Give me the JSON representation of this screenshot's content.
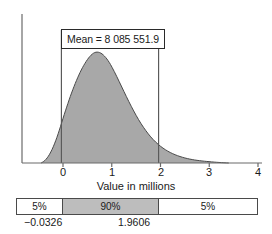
{
  "chart_data": {
    "type": "area",
    "title": "",
    "xlabel": "Value in millions",
    "ylabel": "",
    "xlim": [
      -0.95,
      4.2
    ],
    "ylim": [
      0,
      1.12
    ],
    "grid": false,
    "legend": null,
    "xticks": [
      0,
      1,
      2,
      3,
      4
    ],
    "xtick_labels": [
      "0",
      "1",
      "2",
      "3",
      "4"
    ],
    "distribution": "right-skewed density of sampling distribution of the mean",
    "annotations": [
      {
        "name": "mean-callout",
        "text": "Mean = 8 085 551.9",
        "value": 8085551.9
      }
    ],
    "markers": [
      {
        "name": "lower-bound-line",
        "x": -0.0326,
        "label": "-0.0326"
      },
      {
        "name": "upper-bound-line",
        "x": 1.9606,
        "label": "1.9606"
      }
    ],
    "interval_bar": {
      "segments": [
        {
          "label": "5%",
          "percent": 5,
          "shaded": false
        },
        {
          "label": "90%",
          "percent": 90,
          "shaded": true
        },
        {
          "label": "5%",
          "percent": 5,
          "shaded": false
        }
      ],
      "boundaries": [
        "−0.0326",
        "1.9606"
      ]
    },
    "curve_points": [
      [
        -0.45,
        0.0
      ],
      [
        -0.4,
        0.012
      ],
      [
        -0.35,
        0.032
      ],
      [
        -0.3,
        0.06
      ],
      [
        -0.25,
        0.098
      ],
      [
        -0.2,
        0.145
      ],
      [
        -0.15,
        0.2
      ],
      [
        -0.1,
        0.262
      ],
      [
        -0.05,
        0.33
      ],
      [
        0.0,
        0.402
      ],
      [
        0.05,
        0.47
      ],
      [
        0.1,
        0.536
      ],
      [
        0.15,
        0.6
      ],
      [
        0.2,
        0.66
      ],
      [
        0.25,
        0.716
      ],
      [
        0.3,
        0.768
      ],
      [
        0.35,
        0.816
      ],
      [
        0.4,
        0.86
      ],
      [
        0.45,
        0.898
      ],
      [
        0.5,
        0.932
      ],
      [
        0.55,
        0.96
      ],
      [
        0.6,
        0.982
      ],
      [
        0.65,
        0.996
      ],
      [
        0.7,
        1.0
      ],
      [
        0.75,
        0.996
      ],
      [
        0.8,
        0.984
      ],
      [
        0.85,
        0.964
      ],
      [
        0.9,
        0.938
      ],
      [
        0.95,
        0.906
      ],
      [
        1.0,
        0.868
      ],
      [
        1.1,
        0.782
      ],
      [
        1.2,
        0.69
      ],
      [
        1.3,
        0.598
      ],
      [
        1.4,
        0.51
      ],
      [
        1.5,
        0.428
      ],
      [
        1.6,
        0.354
      ],
      [
        1.7,
        0.29
      ],
      [
        1.8,
        0.234
      ],
      [
        1.9,
        0.188
      ],
      [
        2.0,
        0.15
      ],
      [
        2.1,
        0.119
      ],
      [
        2.2,
        0.094
      ],
      [
        2.3,
        0.074
      ],
      [
        2.4,
        0.058
      ],
      [
        2.5,
        0.045
      ],
      [
        2.6,
        0.035
      ],
      [
        2.7,
        0.027
      ],
      [
        2.8,
        0.021
      ],
      [
        2.9,
        0.016
      ],
      [
        3.0,
        0.012
      ],
      [
        3.1,
        0.008
      ],
      [
        3.2,
        0.005
      ],
      [
        3.3,
        0.002
      ],
      [
        3.4,
        0.0
      ]
    ]
  },
  "axis": {
    "title": "Value in millions",
    "ticks": [
      "0",
      "1",
      "2",
      "3",
      "4"
    ]
  },
  "callout": {
    "mean_label": "Mean = 8 085 551.9"
  },
  "interval": {
    "left_pct": "5%",
    "mid_pct": "90%",
    "right_pct": "5%",
    "lower_bound": "−0.0326",
    "upper_bound": "1.9606"
  },
  "colors": {
    "fill": "#a8a8a8",
    "fill_light": "#bdbdbd",
    "stroke": "#4a4a4a",
    "axis": "#6b6b6b",
    "text": "#1a1a1a"
  }
}
